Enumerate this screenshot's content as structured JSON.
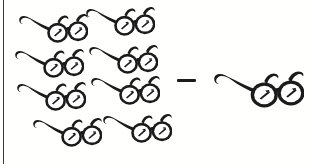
{
  "diagram": {
    "type": "subtraction-pictograph",
    "title": "Eyeglasses subtraction pictograph",
    "background_color": "#fffffe",
    "ink_color": "#1b1b1b",
    "rule_color": "#3a3a3a",
    "operator": {
      "name": "minus",
      "glyph": "–",
      "label": "minus",
      "x": 177,
      "y": 79,
      "width": 19,
      "height": 3
    },
    "minuend": {
      "label": "8",
      "count": 8,
      "icon_name": "eyeglasses-icon",
      "rows": 4,
      "columns": 2,
      "items": [
        {
          "x": 16,
          "y": 8,
          "w": 72,
          "h": 40
        },
        {
          "x": 83,
          "y": 1,
          "w": 72,
          "h": 40
        },
        {
          "x": 12,
          "y": 43,
          "w": 72,
          "h": 40
        },
        {
          "x": 86,
          "y": 39,
          "w": 72,
          "h": 40
        },
        {
          "x": 14,
          "y": 76,
          "w": 72,
          "h": 40
        },
        {
          "x": 88,
          "y": 70,
          "w": 72,
          "h": 40
        },
        {
          "x": 30,
          "y": 112,
          "w": 72,
          "h": 40
        },
        {
          "x": 100,
          "y": 108,
          "w": 72,
          "h": 40
        }
      ]
    },
    "subtrahend": {
      "label": "1",
      "count": 1,
      "icon_name": "eyeglasses-icon",
      "items": [
        {
          "x": 210,
          "y": 64,
          "w": 94,
          "h": 50
        }
      ]
    },
    "left_rule": {
      "x": 3,
      "y": 0,
      "width": 1,
      "height": 164
    }
  }
}
